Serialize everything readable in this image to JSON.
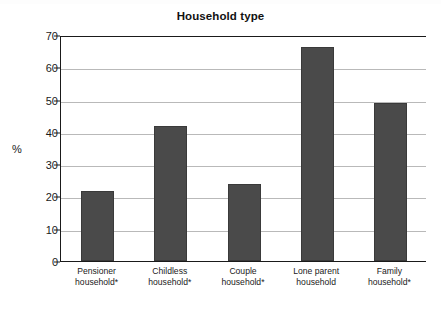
{
  "chart_data": {
    "type": "bar",
    "title": "Household type",
    "xlabel": "",
    "ylabel": "%",
    "categories": [
      "Pensioner household*",
      "Childless household*",
      "Couple household*",
      "Lone parent household",
      "Family household*"
    ],
    "category_lines": [
      [
        "Pensioner",
        "household*"
      ],
      [
        "Childless",
        "household*"
      ],
      [
        "Couple",
        "household*"
      ],
      [
        "Lone parent",
        "household"
      ],
      [
        "Family",
        "household*"
      ]
    ],
    "values": [
      21.7,
      41.7,
      23.8,
      66.3,
      49.0
    ],
    "ylim": [
      0,
      70
    ],
    "ytick_labels": [
      "70",
      "60",
      "50",
      "40",
      "30",
      "20",
      "10",
      "0"
    ],
    "ytick_values": [
      70,
      60,
      50,
      40,
      30,
      20,
      10,
      0
    ],
    "grid": true,
    "legend": "none",
    "bar_color": "#4a4a4a",
    "grid_color": "#b9b9b9",
    "axis_color": "#1a1a1a"
  }
}
